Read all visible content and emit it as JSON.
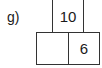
{
  "problem": {
    "label": "g)",
    "top_value": "10",
    "bottom_left_value": "",
    "bottom_right_value": "6"
  }
}
